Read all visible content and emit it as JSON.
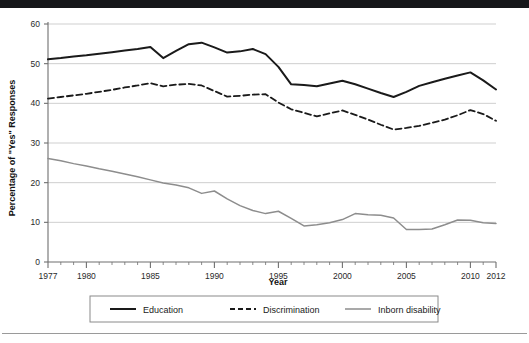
{
  "figure": {
    "background_color": "#ffffff",
    "top_bar_color": "#16171a",
    "rule_color": "#9a9a9a"
  },
  "chart_data": {
    "type": "line",
    "title": "",
    "subtitle": "",
    "xlabel": "Year",
    "ylabel": "Percentage of \"Yes\" Responses",
    "xlim": [
      1977,
      2012
    ],
    "ylim": [
      0,
      60
    ],
    "yticks": [
      0,
      10,
      20,
      30,
      40,
      50,
      60
    ],
    "ytick_labels": [
      "0",
      "10",
      "20",
      "30",
      "40",
      "50",
      "60"
    ],
    "xticks": [
      1977,
      1980,
      1985,
      1990,
      1995,
      2000,
      2005,
      2010,
      2012
    ],
    "xtick_labels": [
      "1977",
      "1980",
      "1985",
      "1990",
      "1995",
      "2000",
      "2005",
      "2010",
      "2012"
    ],
    "minor_xticks_every": 1,
    "grid": "horizontal",
    "grid_color": "#c9c9c9",
    "legend_position": "below",
    "legend": [
      "Education",
      "Discrimination",
      "Inborn disability"
    ],
    "x": [
      1977,
      1978,
      1979,
      1980,
      1981,
      1982,
      1983,
      1984,
      1985,
      1986,
      1987,
      1988,
      1989,
      1990,
      1991,
      1992,
      1993,
      1994,
      1995,
      1996,
      1997,
      1998,
      1999,
      2000,
      2001,
      2002,
      2003,
      2004,
      2005,
      2006,
      2007,
      2008,
      2009,
      2010,
      2011,
      2012
    ],
    "series": [
      {
        "name": "Education",
        "color": "#1a1a1a",
        "style": "solid",
        "width": 2.0,
        "values": [
          51.1,
          51.4,
          51.8,
          52.1,
          52.5,
          52.9,
          53.3,
          53.7,
          54.2,
          51.4,
          53.2,
          54.9,
          55.3,
          54.1,
          52.8,
          53.1,
          53.7,
          52.4,
          49.2,
          44.8,
          44.6,
          44.3,
          45.0,
          45.7,
          44.8,
          43.7,
          42.6,
          41.6,
          42.9,
          44.4,
          45.3,
          46.2,
          47.0,
          47.8,
          45.8,
          43.5
        ]
      },
      {
        "name": "Discrimination",
        "color": "#1a1a1a",
        "style": "dashed",
        "width": 1.8,
        "values": [
          41.2,
          41.6,
          42.0,
          42.4,
          42.9,
          43.4,
          44.0,
          44.5,
          45.1,
          44.3,
          44.7,
          44.9,
          44.5,
          43.1,
          41.7,
          41.9,
          42.2,
          42.3,
          40.2,
          38.5,
          37.6,
          36.7,
          37.5,
          38.2,
          37.1,
          35.9,
          34.6,
          33.4,
          33.8,
          34.3,
          35.1,
          35.9,
          37.0,
          38.3,
          37.3,
          35.6
        ]
      },
      {
        "name": "Inborn disability",
        "color": "#8d8d8d",
        "style": "solid",
        "width": 1.5,
        "values": [
          26.1,
          25.5,
          24.8,
          24.2,
          23.5,
          22.9,
          22.2,
          21.5,
          20.7,
          19.9,
          19.4,
          18.7,
          17.3,
          17.9,
          15.9,
          14.2,
          13.0,
          12.2,
          12.8,
          11.0,
          9.1,
          9.4,
          9.9,
          10.7,
          12.2,
          11.9,
          11.8,
          11.1,
          8.2,
          8.2,
          8.3,
          9.4,
          10.6,
          10.5,
          9.9,
          9.7
        ]
      }
    ]
  },
  "axes": {
    "y_title": "Percentage of \"Yes\" Responses",
    "x_title": "Year"
  },
  "legend_items": [
    {
      "label": "Education",
      "style": "solid",
      "color": "#1a1a1a"
    },
    {
      "label": "Discrimination",
      "style": "dashed",
      "color": "#1a1a1a"
    },
    {
      "label": "Inborn disability",
      "style": "solid",
      "color": "#8d8d8d"
    }
  ]
}
